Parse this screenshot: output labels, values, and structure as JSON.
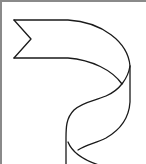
{
  "image": {
    "subject": "ribbon-banner-outline",
    "description": "Line-art drawing of a twisted ribbon banner with a notched tail",
    "colors": {
      "stroke": "#1a1a1a",
      "frame": "#8a8a8a",
      "background": "#ffffff"
    }
  }
}
